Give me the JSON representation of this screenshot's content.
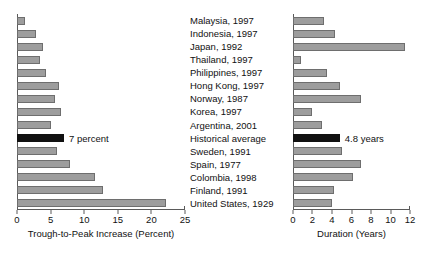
{
  "chart_data": [
    {
      "type": "bar",
      "orientation": "horizontal",
      "panel": "left",
      "title": "",
      "xlabel": "Trough-to-Peak Increase (Percent)",
      "ylabel": "",
      "xlim": [
        0,
        25
      ],
      "xticks": [
        0,
        5,
        10,
        15,
        20,
        25
      ],
      "grid": false,
      "legend": "none",
      "categories": [
        "Malaysia, 1997",
        "Indonesia, 1997",
        "Japan, 1992",
        "Thailand, 1997",
        "Philippines, 1997",
        "Hong Kong, 1997",
        "Norway, 1987",
        "Korea, 1997",
        "Argentina, 2001",
        "Historical average",
        "Sweden, 1991",
        "Spain, 1977",
        "Colombia, 1998",
        "Finland, 1991",
        "United States, 1929"
      ],
      "values": [
        1.2,
        2.9,
        3.9,
        3.4,
        4.3,
        6.2,
        5.6,
        6.6,
        5.1,
        7.0,
        5.9,
        7.9,
        11.6,
        12.8,
        22.2
      ],
      "highlight_index": 9,
      "annotations": [
        {
          "index": 9,
          "text": "7 percent"
        }
      ]
    },
    {
      "type": "bar",
      "orientation": "horizontal",
      "panel": "right",
      "title": "",
      "xlabel": "Duration (Years)",
      "ylabel": "",
      "xlim": [
        0,
        12
      ],
      "xticks": [
        0,
        2,
        4,
        6,
        8,
        10,
        12
      ],
      "grid": false,
      "legend": "none",
      "categories": [
        "Malaysia, 1997",
        "Indonesia, 1997",
        "Japan, 1992",
        "Thailand, 1997",
        "Philippines, 1997",
        "Hong Kong, 1997",
        "Norway, 1987",
        "Korea, 1997",
        "Argentina, 2001",
        "Historical average",
        "Sweden, 1991",
        "Spain, 1977",
        "Colombia, 1998",
        "Finland, 1991",
        "United States, 1929"
      ],
      "values": [
        3.2,
        4.3,
        11.5,
        0.8,
        3.5,
        4.8,
        7.0,
        1.9,
        3.0,
        4.8,
        5.0,
        7.0,
        6.2,
        4.2,
        4.0
      ],
      "highlight_index": 9,
      "annotations": [
        {
          "index": 9,
          "text": "4.8 years"
        }
      ]
    }
  ],
  "colors": {
    "bar_fill": "#9d9d9d",
    "bar_stroke": "#6e6e6e",
    "highlight_fill": "#111111",
    "axis": "#5a5a5a",
    "text": "#111111",
    "background": "#ffffff"
  }
}
